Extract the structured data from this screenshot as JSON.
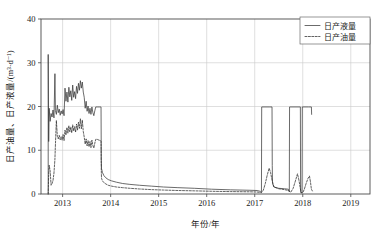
{
  "chart_data": {
    "type": "line",
    "title": "",
    "xlabel": "年份/年",
    "ylabel": "日产油量、日产液量/(m³·d⁻¹)",
    "xlim": [
      2012.55,
      2019.4
    ],
    "ylim": [
      0,
      40
    ],
    "xticks": [
      2013,
      2014,
      2015,
      2016,
      2017,
      2018,
      2019
    ],
    "xtick_labels": [
      "2013",
      "2014",
      "2015",
      "2016",
      "2017",
      "2018",
      "2019"
    ],
    "yticks": [
      0,
      10,
      20,
      30,
      40
    ],
    "ytick_labels": [
      "0",
      "10",
      "20",
      "30",
      "40"
    ],
    "grid": true,
    "legend_position": "top-right",
    "legend": [
      "日产液量",
      "日产油量"
    ],
    "series": [
      {
        "name": "日产液量",
        "style": "solid",
        "color": "#3a3a3a",
        "points": [
          [
            2012.7,
            0.0
          ],
          [
            2012.7,
            31.9
          ],
          [
            2012.71,
            12.0
          ],
          [
            2012.72,
            19.6
          ],
          [
            2012.74,
            16.6
          ],
          [
            2012.76,
            18.4
          ],
          [
            2012.78,
            17.6
          ],
          [
            2012.8,
            19.2
          ],
          [
            2012.82,
            17.4
          ],
          [
            2012.84,
            27.5
          ],
          [
            2012.85,
            19.1
          ],
          [
            2012.87,
            18.2
          ],
          [
            2012.89,
            20.3
          ],
          [
            2012.91,
            18.6
          ],
          [
            2012.93,
            19.4
          ],
          [
            2012.95,
            18.0
          ],
          [
            2012.97,
            19.0
          ],
          [
            2012.99,
            18.3
          ],
          [
            2013.01,
            19.3
          ],
          [
            2013.03,
            17.9
          ],
          [
            2013.05,
            24.2
          ],
          [
            2013.07,
            21.2
          ],
          [
            2013.09,
            23.3
          ],
          [
            2013.11,
            21.0
          ],
          [
            2013.13,
            24.4
          ],
          [
            2013.15,
            22.2
          ],
          [
            2013.17,
            23.6
          ],
          [
            2013.19,
            21.4
          ],
          [
            2013.21,
            24.9
          ],
          [
            2013.23,
            22.1
          ],
          [
            2013.25,
            23.4
          ],
          [
            2013.27,
            21.8
          ],
          [
            2013.29,
            24.6
          ],
          [
            2013.31,
            23.0
          ],
          [
            2013.33,
            25.3
          ],
          [
            2013.35,
            23.7
          ],
          [
            2013.37,
            25.9
          ],
          [
            2013.39,
            24.2
          ],
          [
            2013.41,
            25.6
          ],
          [
            2013.43,
            23.3
          ],
          [
            2013.45,
            22.1
          ],
          [
            2013.47,
            19.6
          ],
          [
            2013.49,
            21.2
          ],
          [
            2013.51,
            18.9
          ],
          [
            2013.53,
            20.1
          ],
          [
            2013.55,
            18.4
          ],
          [
            2013.57,
            19.6
          ],
          [
            2013.59,
            18.2
          ],
          [
            2013.61,
            19.9
          ],
          [
            2013.63,
            18.6
          ],
          [
            2013.65,
            17.9
          ],
          [
            2013.67,
            19.0
          ],
          [
            2013.69,
            19.9
          ],
          [
            2013.72,
            19.9
          ],
          [
            2013.76,
            19.9
          ],
          [
            2013.78,
            19.9
          ],
          [
            2013.8,
            19.9
          ],
          [
            2013.805,
            8.0
          ],
          [
            2013.81,
            5.8
          ],
          [
            2013.83,
            4.9
          ],
          [
            2013.86,
            4.2
          ],
          [
            2013.9,
            3.7
          ],
          [
            2013.95,
            3.3
          ],
          [
            2014.02,
            3.0
          ],
          [
            2014.12,
            2.7
          ],
          [
            2014.25,
            2.4
          ],
          [
            2014.4,
            2.2
          ],
          [
            2014.6,
            2.0
          ],
          [
            2014.85,
            1.8
          ],
          [
            2015.1,
            1.6
          ],
          [
            2015.4,
            1.45
          ],
          [
            2015.75,
            1.3
          ],
          [
            2016.1,
            1.1
          ],
          [
            2016.5,
            0.95
          ],
          [
            2016.9,
            0.85
          ],
          [
            2017.05,
            0.8
          ],
          [
            2017.12,
            0.6
          ],
          [
            2017.14,
            0.4
          ],
          [
            2017.145,
            19.9
          ],
          [
            2017.3,
            19.9
          ],
          [
            2017.36,
            19.9
          ],
          [
            2017.365,
            6.5
          ],
          [
            2017.37,
            2.4
          ],
          [
            2017.4,
            1.6
          ],
          [
            2017.5,
            1.3
          ],
          [
            2017.62,
            1.2
          ],
          [
            2017.7,
            1.1
          ],
          [
            2017.72,
            0.5
          ],
          [
            2017.725,
            19.9
          ],
          [
            2017.88,
            19.9
          ],
          [
            2017.95,
            19.9
          ],
          [
            2017.955,
            0.4
          ],
          [
            2017.96,
            0.3
          ],
          [
            2017.985,
            0.3
          ],
          [
            2017.99,
            19.9
          ],
          [
            2018.12,
            19.9
          ],
          [
            2018.18,
            19.9
          ],
          [
            2018.185,
            18.2
          ]
        ]
      },
      {
        "name": "日产油量",
        "style": "dashed",
        "color": "#2e2e2e",
        "points": [
          [
            2012.7,
            0.0
          ],
          [
            2012.71,
            4.6
          ],
          [
            2012.72,
            6.6
          ],
          [
            2012.74,
            5.3
          ],
          [
            2012.76,
            2.0
          ],
          [
            2012.78,
            2.4
          ],
          [
            2012.8,
            3.1
          ],
          [
            2012.82,
            4.8
          ],
          [
            2012.84,
            8.0
          ],
          [
            2012.85,
            11.2
          ],
          [
            2012.87,
            16.8
          ],
          [
            2012.89,
            13.2
          ],
          [
            2012.91,
            12.6
          ],
          [
            2012.93,
            13.4
          ],
          [
            2012.95,
            12.4
          ],
          [
            2012.97,
            13.1
          ],
          [
            2012.99,
            12.3
          ],
          [
            2013.01,
            13.6
          ],
          [
            2013.03,
            12.2
          ],
          [
            2013.05,
            14.6
          ],
          [
            2013.07,
            13.5
          ],
          [
            2013.09,
            15.2
          ],
          [
            2013.11,
            13.9
          ],
          [
            2013.13,
            15.6
          ],
          [
            2013.15,
            14.2
          ],
          [
            2013.17,
            15.3
          ],
          [
            2013.19,
            14.0
          ],
          [
            2013.21,
            15.8
          ],
          [
            2013.23,
            14.4
          ],
          [
            2013.25,
            15.4
          ],
          [
            2013.27,
            14.1
          ],
          [
            2013.29,
            16.0
          ],
          [
            2013.31,
            14.6
          ],
          [
            2013.33,
            16.4
          ],
          [
            2013.35,
            15.0
          ],
          [
            2013.37,
            17.2
          ],
          [
            2013.39,
            14.9
          ],
          [
            2013.41,
            16.9
          ],
          [
            2013.43,
            14.3
          ],
          [
            2013.45,
            13.0
          ],
          [
            2013.47,
            11.4
          ],
          [
            2013.49,
            12.6
          ],
          [
            2013.51,
            11.0
          ],
          [
            2013.53,
            12.2
          ],
          [
            2013.55,
            10.8
          ],
          [
            2013.57,
            12.0
          ],
          [
            2013.59,
            10.6
          ],
          [
            2013.61,
            12.3
          ],
          [
            2013.63,
            11.1
          ],
          [
            2013.65,
            10.5
          ],
          [
            2013.67,
            11.6
          ],
          [
            2013.69,
            12.5
          ],
          [
            2013.72,
            12.5
          ],
          [
            2013.76,
            12.3
          ],
          [
            2013.79,
            12.2
          ],
          [
            2013.8,
            12.1
          ],
          [
            2013.805,
            5.5
          ],
          [
            2013.81,
            3.6
          ],
          [
            2013.83,
            3.0
          ],
          [
            2013.86,
            2.6
          ],
          [
            2013.9,
            2.3
          ],
          [
            2013.95,
            2.0
          ],
          [
            2014.02,
            1.8
          ],
          [
            2014.12,
            1.6
          ],
          [
            2014.25,
            1.45
          ],
          [
            2014.4,
            1.3
          ],
          [
            2014.6,
            1.15
          ],
          [
            2014.85,
            1.0
          ],
          [
            2015.1,
            0.9
          ],
          [
            2015.4,
            0.8
          ],
          [
            2015.75,
            0.72
          ],
          [
            2016.1,
            0.62
          ],
          [
            2016.5,
            0.55
          ],
          [
            2016.9,
            0.5
          ],
          [
            2017.05,
            0.45
          ],
          [
            2017.14,
            0.3
          ],
          [
            2017.18,
            0.9
          ],
          [
            2017.22,
            2.4
          ],
          [
            2017.26,
            4.3
          ],
          [
            2017.3,
            5.9
          ],
          [
            2017.33,
            4.9
          ],
          [
            2017.36,
            3.2
          ],
          [
            2017.4,
            1.6
          ],
          [
            2017.5,
            1.2
          ],
          [
            2017.62,
            1.0
          ],
          [
            2017.7,
            0.8
          ],
          [
            2017.75,
            0.4
          ],
          [
            2017.8,
            1.3
          ],
          [
            2017.85,
            3.1
          ],
          [
            2017.89,
            4.6
          ],
          [
            2017.92,
            3.2
          ],
          [
            2017.95,
            1.2
          ],
          [
            2017.97,
            0.3
          ],
          [
            2018.0,
            0.3
          ],
          [
            2018.03,
            1.0
          ],
          [
            2018.07,
            2.4
          ],
          [
            2018.11,
            3.6
          ],
          [
            2018.14,
            4.1
          ],
          [
            2018.16,
            2.8
          ],
          [
            2018.18,
            1.1
          ],
          [
            2018.2,
            0.7
          ]
        ]
      }
    ]
  },
  "axes": {
    "x_title": "年份/年",
    "y_title": "日产油量、日产液量/(m³·d⁻¹)"
  },
  "legend": {
    "items": [
      {
        "label": "日产液量",
        "style": "solid"
      },
      {
        "label": "日产油量",
        "style": "dashed"
      }
    ]
  }
}
